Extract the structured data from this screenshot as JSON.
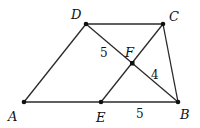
{
  "diagram": {
    "type": "geometry",
    "points": {
      "A": {
        "label": "A",
        "x": 24,
        "y": 102
      },
      "B": {
        "label": "B",
        "x": 178,
        "y": 102
      },
      "C": {
        "label": "C",
        "x": 163,
        "y": 24
      },
      "D": {
        "label": "D",
        "x": 86,
        "y": 24
      },
      "E": {
        "label": "E",
        "x": 101,
        "y": 102
      },
      "F": {
        "label": "F",
        "x": 132,
        "y": 63
      }
    },
    "segments": [
      "AB",
      "BC",
      "CD",
      "DA",
      "DB",
      "CE"
    ],
    "measures": {
      "DF": "5",
      "FB": "4",
      "EB": "5"
    },
    "colors": {
      "stroke": "#2a2a2a",
      "point": "#111111"
    }
  }
}
